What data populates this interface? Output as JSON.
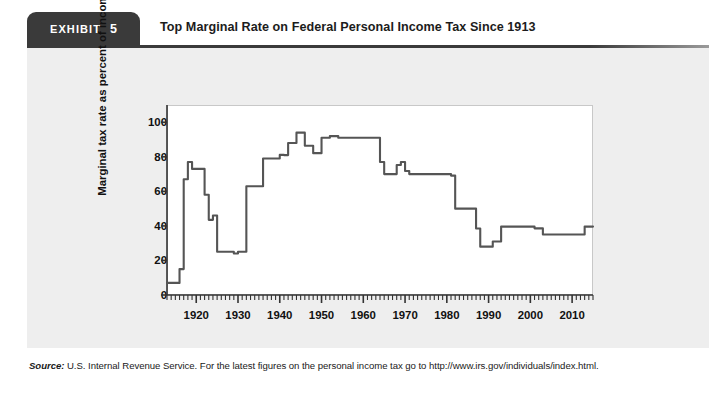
{
  "exhibit": {
    "tab_word": "EXHIBIT",
    "tab_number": "5",
    "title": "Top Marginal Rate on Federal Personal Income Tax Since 1913"
  },
  "source": {
    "label": "Source:",
    "text": " U.S. Internal Revenue Service. For the latest figures on the personal income tax go to http://www.irs.gov/individuals/index.html."
  },
  "chart_data": {
    "type": "line",
    "title": "Top Marginal Rate on Federal Personal Income Tax Since 1913",
    "xlabel": "",
    "ylabel": "Marginal tax rate as percent of income",
    "xlim": [
      1913,
      2015
    ],
    "ylim": [
      0,
      110
    ],
    "grid": false,
    "legend": "none",
    "line_color": "#555555",
    "ytick_labels": [
      "0",
      "20",
      "40",
      "60",
      "80",
      "100"
    ],
    "ytick_values": [
      0,
      20,
      40,
      60,
      80,
      100
    ],
    "xtick_labels": [
      "1920",
      "1930",
      "1940",
      "1950",
      "1960",
      "1970",
      "1980",
      "1990",
      "2000",
      "2010"
    ],
    "xtick_values": [
      1920,
      1930,
      1940,
      1950,
      1960,
      1970,
      1980,
      1990,
      2000,
      2010
    ],
    "x_minor_tick_interval": 1,
    "series": [
      {
        "name": "Top marginal tax rate",
        "x": [
          1913,
          1914,
          1915,
          1916,
          1917,
          1918,
          1919,
          1920,
          1921,
          1922,
          1923,
          1924,
          1925,
          1926,
          1927,
          1928,
          1929,
          1930,
          1931,
          1932,
          1933,
          1934,
          1935,
          1936,
          1937,
          1938,
          1939,
          1940,
          1941,
          1942,
          1943,
          1944,
          1945,
          1946,
          1947,
          1948,
          1949,
          1950,
          1951,
          1952,
          1953,
          1954,
          1955,
          1956,
          1957,
          1958,
          1959,
          1960,
          1961,
          1962,
          1963,
          1964,
          1965,
          1966,
          1967,
          1968,
          1969,
          1970,
          1971,
          1972,
          1973,
          1974,
          1975,
          1976,
          1977,
          1978,
          1979,
          1980,
          1981,
          1982,
          1983,
          1984,
          1985,
          1986,
          1987,
          1988,
          1989,
          1990,
          1991,
          1992,
          1993,
          1994,
          1995,
          1996,
          1997,
          1998,
          1999,
          2000,
          2001,
          2002,
          2003,
          2004,
          2005,
          2006,
          2007,
          2008,
          2009,
          2010,
          2011,
          2012,
          2013,
          2014,
          2015
        ],
        "values": [
          7,
          7,
          7,
          15,
          67,
          77,
          73,
          73,
          73,
          58,
          43.5,
          46,
          25,
          25,
          25,
          25,
          24,
          25,
          25,
          63,
          63,
          63,
          63,
          79,
          79,
          79,
          79,
          81.1,
          81,
          88,
          88,
          94,
          94,
          86.45,
          86.45,
          82.13,
          82.13,
          91,
          91,
          92,
          92,
          91,
          91,
          91,
          91,
          91,
          91,
          91,
          91,
          91,
          91,
          77,
          70,
          70,
          70,
          75.25,
          77,
          71.75,
          70,
          70,
          70,
          70,
          70,
          70,
          70,
          70,
          70,
          70,
          69.13,
          50,
          50,
          50,
          50,
          50,
          38.5,
          28,
          28,
          28,
          31,
          31,
          39.6,
          39.6,
          39.6,
          39.6,
          39.6,
          39.6,
          39.6,
          39.6,
          38.6,
          38.6,
          35,
          35,
          35,
          35,
          35,
          35,
          35,
          35,
          35,
          35,
          39.6,
          39.6,
          39.6
        ]
      }
    ]
  }
}
